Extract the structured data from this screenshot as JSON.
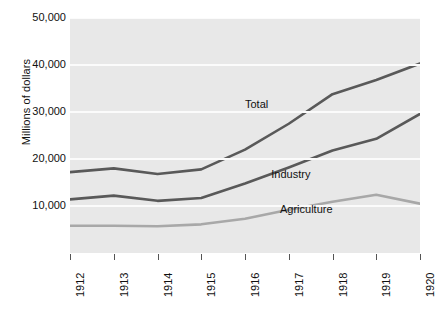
{
  "chart_data": {
    "type": "line",
    "title": "",
    "subtitle": "",
    "xlabel": "",
    "ylabel": "Millions of dollars",
    "categories": [
      "1912",
      "1913",
      "1914",
      "1915",
      "1916",
      "1917",
      "1918",
      "1919",
      "1920"
    ],
    "ylim": [
      0,
      50000
    ],
    "ytick_labels": [
      "50,000",
      "40,000",
      "30,000",
      "20,000",
      "10,000"
    ],
    "ytick_values": [
      50000,
      40000,
      30000,
      20000,
      10000
    ],
    "grid": true,
    "grid_axis": "y",
    "legend": "inline-annotations",
    "plot_background": "#e8e8e8",
    "series": [
      {
        "name": "Total",
        "color": "#595959",
        "values": [
          17200,
          18000,
          16800,
          17800,
          22000,
          27500,
          33800,
          36800,
          40300
        ],
        "annotation": {
          "label": "Total",
          "x": 1916,
          "y": 31500
        }
      },
      {
        "name": "Industry",
        "color": "#595959",
        "values": [
          11400,
          12200,
          11100,
          11700,
          14800,
          18200,
          21800,
          24300,
          29600
        ],
        "annotation": {
          "label": "Industry",
          "x": 1916.6,
          "y": 16500
        }
      },
      {
        "name": "Agriculture",
        "color": "#a8a8a8",
        "values": [
          5800,
          5800,
          5700,
          6100,
          7300,
          9200,
          10900,
          12400,
          10500
        ],
        "annotation": {
          "label": "Agriculture",
          "x": 1916.8,
          "y": 9200
        }
      }
    ]
  }
}
